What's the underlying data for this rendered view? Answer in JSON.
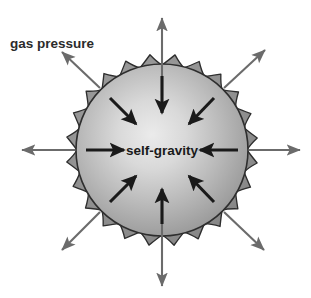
{
  "figure": {
    "title": "",
    "background_color": "#ffffff",
    "width": 311,
    "height": 298
  },
  "labels": {
    "gas_pressure": "gas pressure",
    "self_gravity": "self-gravity"
  },
  "colors": {
    "outward_arrow": "#6b6b6b",
    "inward_arrow": "#1a1a1a",
    "sphere_outline": "#2e2e2e",
    "sphere_center": "#e8e8e8",
    "sphere_edge": "#8a8a8a",
    "spike_fill": "#7e7e7e",
    "text": "#2b2b2b",
    "background": "#ffffff"
  },
  "sphere": {
    "center_x": 162,
    "center_y": 150,
    "radius": 86,
    "spike_count": 24,
    "spike_length": 10,
    "gradient_highlight_x": 150,
    "gradient_highlight_y": 138
  },
  "chart_data": {
    "type": "diagram",
    "annotations": [
      "gas pressure",
      "self-gravity"
    ],
    "outward_arrows": [
      {
        "name": "up",
        "angle_deg": 90,
        "from_r": 96,
        "to_r": 148
      },
      {
        "name": "up-right",
        "angle_deg": 45,
        "from_r": 96,
        "to_r": 152
      },
      {
        "name": "right",
        "angle_deg": 0,
        "from_r": 96,
        "to_r": 142
      },
      {
        "name": "down-right",
        "angle_deg": -45,
        "from_r": 96,
        "to_r": 152
      },
      {
        "name": "down",
        "angle_deg": -90,
        "from_r": 96,
        "to_r": 148
      },
      {
        "name": "down-left",
        "angle_deg": -135,
        "from_r": 96,
        "to_r": 152
      },
      {
        "name": "left",
        "angle_deg": 180,
        "from_r": 96,
        "to_r": 142
      },
      {
        "name": "up-left",
        "angle_deg": 135,
        "from_r": 96,
        "to_r": 152
      }
    ],
    "inward_arrows": [
      {
        "name": "from-top",
        "angle_deg": 90,
        "from_r": 78,
        "to_r": 32
      },
      {
        "name": "from-top-right",
        "angle_deg": 45,
        "from_r": 78,
        "to_r": 32
      },
      {
        "name": "from-right",
        "angle_deg": 0,
        "from_r": 78,
        "to_r": 32
      },
      {
        "name": "from-bottom-right",
        "angle_deg": -45,
        "from_r": 78,
        "to_r": 32
      },
      {
        "name": "from-bottom",
        "angle_deg": -90,
        "from_r": 78,
        "to_r": 32
      },
      {
        "name": "from-bottom-left",
        "angle_deg": -135,
        "from_r": 78,
        "to_r": 32
      },
      {
        "name": "from-left",
        "angle_deg": 180,
        "from_r": 78,
        "to_r": 32
      },
      {
        "name": "from-top-left",
        "angle_deg": 135,
        "from_r": 78,
        "to_r": 32
      }
    ]
  }
}
